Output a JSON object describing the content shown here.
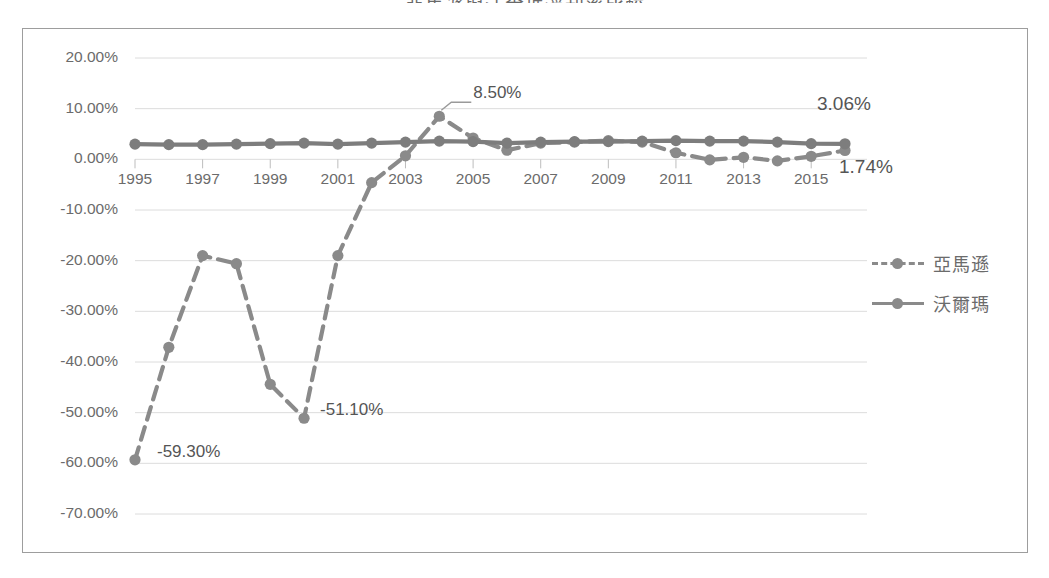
{
  "chart_data": {
    "type": "line",
    "title": "亞馬遜與沃爾瑪淨利率比較",
    "xlabel": "",
    "ylabel": "",
    "ylim": [
      -70,
      20
    ],
    "ytick_step": 10,
    "ytick_labels": [
      "20.00%",
      "10.00%",
      "0.00%",
      "-10.00%",
      "-20.00%",
      "-30.00%",
      "-40.00%",
      "-50.00%",
      "-60.00%",
      "-70.00%"
    ],
    "ytick_values": [
      20,
      10,
      0,
      -10,
      -20,
      -30,
      -40,
      -50,
      -60,
      -70
    ],
    "x": [
      1995,
      1996,
      1997,
      1998,
      1999,
      2000,
      2001,
      2002,
      2003,
      2004,
      2005,
      2006,
      2007,
      2008,
      2009,
      2010,
      2011,
      2012,
      2013,
      2014,
      2015,
      2016
    ],
    "xtick_labels": [
      "1995",
      "1997",
      "1999",
      "2001",
      "2003",
      "2005",
      "2007",
      "2009",
      "2011",
      "2013",
      "2015"
    ],
    "xtick_values": [
      1995,
      1997,
      1999,
      2001,
      2003,
      2005,
      2007,
      2009,
      2011,
      2013,
      2015
    ],
    "grid": true,
    "legend_position": "right",
    "series": [
      {
        "name": "亞馬遜",
        "style": "dashed",
        "color": "#8a8a8a",
        "values": [
          -59.3,
          -37.1,
          -19.0,
          -20.6,
          -44.4,
          -51.1,
          -19.0,
          -4.6,
          0.7,
          8.5,
          4.2,
          1.8,
          3.2,
          3.4,
          3.7,
          3.4,
          1.3,
          -0.1,
          0.4,
          -0.3,
          0.6,
          1.74
        ]
      },
      {
        "name": "沃爾瑪",
        "style": "solid",
        "color": "#7d7d7d",
        "values": [
          3.0,
          2.9,
          2.9,
          3.0,
          3.1,
          3.2,
          3.0,
          3.2,
          3.4,
          3.6,
          3.5,
          3.2,
          3.4,
          3.5,
          3.5,
          3.6,
          3.7,
          3.6,
          3.6,
          3.4,
          3.1,
          3.06
        ]
      }
    ],
    "annotations": [
      {
        "text": "8.50%",
        "series": "亞馬遜",
        "x": 2004,
        "y": 8.5
      },
      {
        "text": "-51.10%",
        "series": "亞馬遜",
        "x": 2000,
        "y": -51.1
      },
      {
        "text": "-59.30%",
        "series": "亞馬遜",
        "x": 1995,
        "y": -59.3
      },
      {
        "text": "1.74%",
        "series": "亞馬遜",
        "x": 2016,
        "y": 1.74
      },
      {
        "text": "3.06%",
        "series": "沃爾瑪",
        "x": 2016,
        "y": 3.06
      }
    ]
  },
  "legend": {
    "items": [
      {
        "label": "亞馬遜",
        "style": "dashed"
      },
      {
        "label": "沃爾瑪",
        "style": "solid"
      }
    ]
  }
}
